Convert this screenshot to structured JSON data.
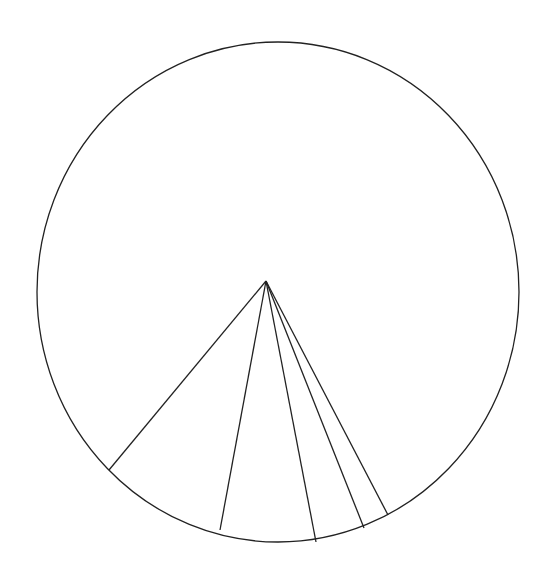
{
  "chart_data": {
    "type": "pie",
    "title": "",
    "labels": [
      "",
      "",
      "",
      "",
      ""
    ],
    "values": [
      81.3,
      8.1,
      5.9,
      3.0,
      1.6
    ],
    "geometry": {
      "ellipse": {
        "cx": 278,
        "cy": 292,
        "rx": 241,
        "ry": 250
      },
      "apex": {
        "x": 266,
        "y": 281
      },
      "spokes": [
        {
          "x": 109,
          "y": 470
        },
        {
          "x": 220,
          "y": 530
        },
        {
          "x": 316,
          "y": 542
        },
        {
          "x": 364,
          "y": 528
        },
        {
          "x": 388,
          "y": 515
        }
      ]
    },
    "stroke_color": "#222222",
    "fill_color": "#ffffff",
    "legend": "none"
  }
}
